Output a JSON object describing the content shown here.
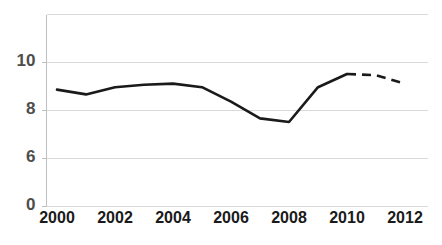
{
  "chart_data": {
    "type": "line",
    "title": "",
    "subtitle": "",
    "xlabel": "",
    "ylabel": "",
    "grid": true,
    "legend": false,
    "legend_position": "none",
    "x": [
      2000,
      2001,
      2002,
      2003,
      2004,
      2005,
      2006,
      2007,
      2008,
      2009,
      2010,
      2011,
      2012
    ],
    "xlim": [
      2000,
      2012
    ],
    "ylim": [
      0,
      12
    ],
    "xtick_labels": [
      "2000",
      "2002",
      "2004",
      "2006",
      "2008",
      "2010",
      "2012"
    ],
    "xtick_values": [
      2000,
      2002,
      2004,
      2006,
      2008,
      2010,
      2012
    ],
    "ytick_labels": [
      "10",
      "8",
      "6",
      "0"
    ],
    "ytick_values": [
      10,
      8,
      6,
      4
    ],
    "gridline_values": [
      12,
      10,
      8,
      6,
      4
    ],
    "series": [
      {
        "name": "",
        "color": "#1a1a1a",
        "values": [
          8.85,
          8.65,
          8.95,
          9.05,
          9.1,
          8.95,
          8.35,
          7.65,
          7.5,
          8.95,
          9.5,
          9.45,
          9.1
        ],
        "solid_through": 2010,
        "dashed_from": 2010,
        "style_solid": "solid",
        "style_dashed": "dashed"
      }
    ]
  },
  "axes": {
    "y_axis_color": "#bfbfbf",
    "grid_color": "#d9d9d9",
    "tick_label_color": "#1a1a1a",
    "ytick_label_color": "#4d4d4d"
  }
}
